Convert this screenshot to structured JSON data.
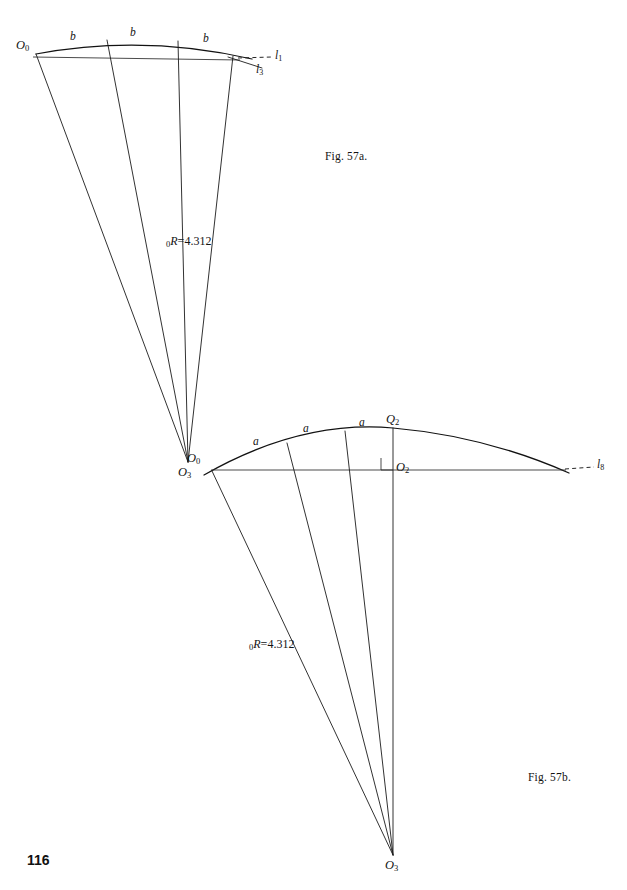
{
  "page": {
    "number": "116",
    "background_color": "#ffffff",
    "ink_color": "#151515"
  },
  "figures": [
    {
      "id": "fig-57a",
      "caption": "Fig. 57a.",
      "apex_label": "O",
      "apex_sub": "3",
      "origin_label": "O",
      "origin_sub": "0",
      "chord_labels": [
        "b",
        "b",
        "b"
      ],
      "radius_label_prefix": "0",
      "radius_label_symbol": "R",
      "radius_label_eq": "=",
      "radius_label_value": "4.312",
      "line_labels": [
        {
          "name": "l",
          "sub": "1"
        },
        {
          "name": "l",
          "sub": "3"
        }
      ]
    },
    {
      "id": "fig-57b",
      "caption": "Fig. 57b.",
      "apex_label": "O",
      "apex_sub": "3",
      "origin_label": "O",
      "origin_sub": "0",
      "crown_point_label": "Q",
      "crown_point_sub": "2",
      "center_point_label": "O",
      "center_point_sub": "2",
      "chord_labels": [
        "a",
        "a",
        "a"
      ],
      "radius_label_prefix": "0",
      "radius_label_symbol": "R",
      "radius_label_eq": "=",
      "radius_label_value": "4.312",
      "line_labels": [
        {
          "name": "l",
          "sub": "8"
        }
      ],
      "right_angle_marker": "right-angle"
    }
  ]
}
